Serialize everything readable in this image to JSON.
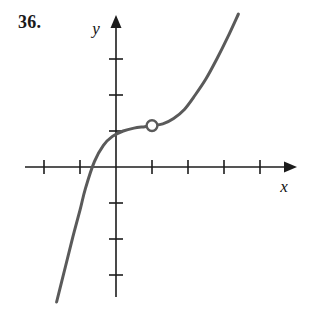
{
  "problem": {
    "number": "36."
  },
  "figure": {
    "x_axis_label": "x",
    "y_axis_label": "y",
    "curve_color": "#5a5a5a",
    "axis_color": "#1c1c1c",
    "background_color": "#ffffff",
    "hole_marker": "open-circle"
  },
  "chart_data": {
    "type": "line",
    "title": "",
    "xlabel": "x",
    "ylabel": "y",
    "grid": false,
    "legend": null,
    "xlim": [
      -2.5,
      4.8
    ],
    "ylim": [
      -3.7,
      4.3
    ],
    "xticks": [
      -2,
      -1,
      1,
      2,
      3,
      4
    ],
    "yticks": [
      -3,
      -2,
      -1,
      1,
      2,
      3
    ],
    "tick_labels_shown": false,
    "annotations": [
      {
        "type": "open-circle",
        "x": 1,
        "y": 1.15,
        "note": "removable discontinuity (hole) on the curve"
      }
    ],
    "series": [
      {
        "name": "f(x)",
        "description": "increasing cubic-like curve, flat near x=0..1, steep at both ends",
        "x": [
          -1.65,
          -1.4,
          -1.2,
          -1.0,
          -0.85,
          -0.6,
          -0.35,
          -0.1,
          0.2,
          0.5,
          0.8,
          1.0,
          1.3,
          1.6,
          1.9,
          2.2,
          2.5,
          2.8,
          3.1,
          3.4
        ],
        "y": [
          -3.75,
          -2.75,
          -1.95,
          -1.2,
          -0.6,
          0.15,
          0.6,
          0.85,
          1.0,
          1.08,
          1.12,
          1.15,
          1.2,
          1.35,
          1.6,
          2.0,
          2.45,
          3.0,
          3.6,
          4.25
        ]
      }
    ]
  }
}
